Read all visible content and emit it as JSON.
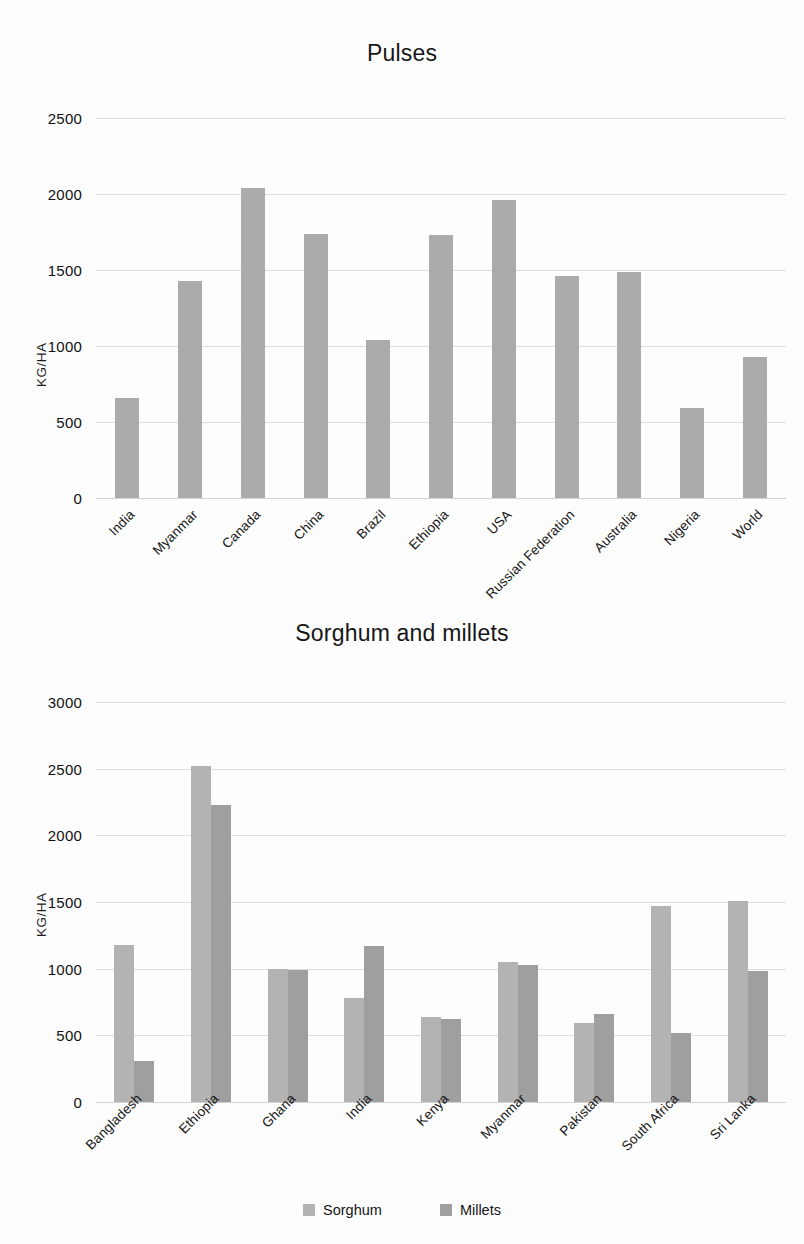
{
  "chart_data": [
    {
      "type": "bar",
      "title": "Pulses",
      "xlabel": "",
      "ylabel": "KG/HA",
      "ylim": [
        0,
        2500
      ],
      "yticks": [
        0,
        500,
        1000,
        1500,
        2000,
        2500
      ],
      "ytick_labels": [
        "0",
        "500",
        "1000",
        "1500",
        "2000",
        "2500"
      ],
      "grid": true,
      "legend": false,
      "categories": [
        "India",
        "Myanmar",
        "Canada",
        "China",
        "Brazil",
        "Ethiopia",
        "USA",
        "Russian Federation",
        "Australia",
        "Nigeria",
        "World"
      ],
      "values": [
        660,
        1430,
        2040,
        1740,
        1040,
        1730,
        1960,
        1460,
        1490,
        590,
        930
      ],
      "bar_color": "#ababab"
    },
    {
      "type": "bar",
      "title": "Sorghum and millets",
      "xlabel": "",
      "ylabel": "KG/HA",
      "ylim": [
        0,
        3000
      ],
      "yticks": [
        0,
        500,
        1000,
        1500,
        2000,
        2500,
        3000
      ],
      "ytick_labels": [
        "0",
        "500",
        "1000",
        "1500",
        "2000",
        "2500",
        "3000"
      ],
      "grid": true,
      "legend": true,
      "legend_position": "bottom",
      "categories": [
        "Bangladesh",
        "Ethiopia",
        "Ghana",
        "India",
        "Kenya",
        "Myanmar",
        "Pakistan",
        "South Africa",
        "Sri Lanka"
      ],
      "series": [
        {
          "name": "Sorghum",
          "color": "#b3b3b3",
          "values": [
            1180,
            2520,
            1000,
            780,
            640,
            1050,
            590,
            1470,
            1510
          ]
        },
        {
          "name": "Millets",
          "color": "#9f9f9f",
          "values": [
            310,
            2230,
            990,
            1170,
            620,
            1030,
            660,
            520,
            980
          ]
        }
      ]
    }
  ]
}
